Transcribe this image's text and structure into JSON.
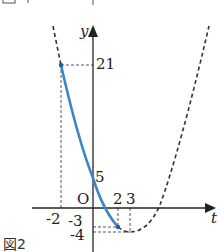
{
  "figure": {
    "caption": "図2",
    "top_caption_fragment": "図1",
    "function": "y = t^2 - 6t + 5",
    "axes": {
      "x_label": "t",
      "y_label": "y",
      "origin_label": "O"
    },
    "tick_labels": {
      "x": [
        "-2",
        "2",
        "3"
      ],
      "y": [
        "21",
        "5",
        "-3",
        "-4"
      ]
    },
    "highlighted_segment": {
      "t_from": -2,
      "t_to": 2,
      "color": "#3a86c8"
    },
    "points": [
      {
        "t": -2,
        "y": 21
      },
      {
        "t": 0,
        "y": 5
      },
      {
        "t": 2,
        "y": -3
      },
      {
        "t": 3,
        "y": -4
      }
    ],
    "colors": {
      "curve": "#3a86c8",
      "axes": "#222222",
      "dashed": "#333333"
    }
  }
}
